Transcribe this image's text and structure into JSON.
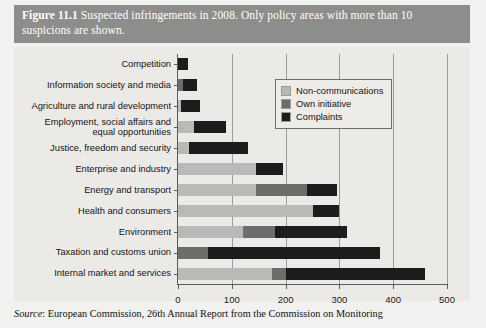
{
  "figure": {
    "number": "Figure 11.1",
    "caption": "Suspected infringements in 2008. Only policy areas with more than 10 suspicions are shown.",
    "source_prefix": "Source",
    "source_text": ": European Commission, 26th Annual Report from the Commission on Monitoring"
  },
  "legend": {
    "position": "inside-upper-right",
    "entries": [
      {
        "label": "Non-communications",
        "color": "#b9b9b7",
        "key": "nc"
      },
      {
        "label": "Own initiative",
        "color": "#6d6d6b",
        "key": "oi"
      },
      {
        "label": "Complaints",
        "color": "#1c1c1c",
        "key": "cp"
      }
    ]
  },
  "chart_data": {
    "type": "bar",
    "orientation": "horizontal",
    "stacked": true,
    "title": "Suspected infringements in 2008. Only policy areas with more than 10 suspicions are shown.",
    "xlabel": "",
    "ylabel": "",
    "xlim": [
      0,
      500
    ],
    "xticks": [
      0,
      100,
      200,
      300,
      400,
      500
    ],
    "xtick_labels": [
      "0",
      "100",
      "200",
      "300",
      "400",
      "500"
    ],
    "grid": "vertical",
    "categories": [
      "Competition",
      "Information society and media",
      "Agriculture and rural development",
      "Employment, social affairs and\nequal opportunities",
      "Justice, freedom and security",
      "Enterprise and industry",
      "Energy and transport",
      "Health and consumers",
      "Environment",
      "Taxation and customs union",
      "Internal market and services"
    ],
    "series": [
      {
        "name": "Non-communications",
        "color": "#b9b9b7",
        "values": [
          0,
          0,
          5,
          30,
          20,
          145,
          145,
          250,
          120,
          0,
          175
        ]
      },
      {
        "name": "Own initiative",
        "color": "#6d6d6b",
        "values": [
          0,
          10,
          0,
          0,
          0,
          0,
          95,
          0,
          60,
          55,
          25
        ]
      },
      {
        "name": "Complaints",
        "color": "#1c1c1c",
        "values": [
          18,
          25,
          35,
          60,
          110,
          50,
          55,
          50,
          135,
          320,
          260
        ]
      }
    ],
    "totals": [
      18,
      35,
      40,
      90,
      130,
      195,
      295,
      300,
      315,
      375,
      460
    ]
  }
}
